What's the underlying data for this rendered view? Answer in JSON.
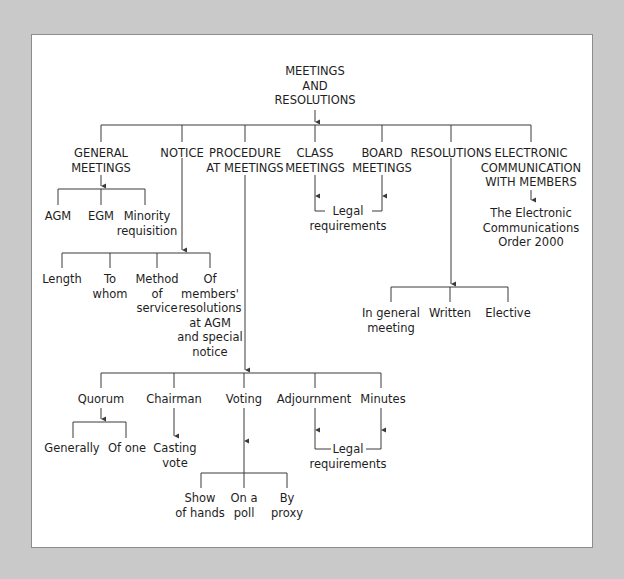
{
  "colors": {
    "background": "#c9c9c9",
    "panel": "#ffffff",
    "line": "#3a3a3a",
    "text": "#1e1e1e"
  },
  "root": "MEETINGS\nAND\nRESOLUTIONS",
  "level1": {
    "general_meetings": "GENERAL\nMEETINGS",
    "notice": "NOTICE",
    "procedure": "PROCEDURE\nAT MEETINGS",
    "class_meetings": "CLASS\nMEETINGS",
    "board_meetings": "BOARD\nMEETINGS",
    "resolutions": "RESOLUTIONS",
    "electronic": "ELECTRONIC\nCOMMUNICATION\nWITH MEMBERS"
  },
  "general_meetings_children": [
    "AGM",
    "EGM",
    "Minority\nrequisition"
  ],
  "notice_children": [
    "Length",
    "To\nwhom",
    "Method\nof\nservice",
    "Of\nmembers'\nresolutions\nat AGM\nand special\nnotice"
  ],
  "meetings_legal": "Legal\nrequirements",
  "electronic_child": "The Electronic\nCommunications\nOrder 2000",
  "resolutions_children": [
    "In general\nmeeting",
    "Written",
    "Elective"
  ],
  "procedure_children": [
    "Quorum",
    "Chairman",
    "Voting",
    "Adjournment",
    "Minutes"
  ],
  "quorum_children": [
    "Generally",
    "Of one"
  ],
  "chairman_child": "Casting\nvote",
  "procedure_legal": "Legal\nrequirements",
  "voting_children": [
    "Show\nof hands",
    "On a\npoll",
    "By\nproxy"
  ]
}
